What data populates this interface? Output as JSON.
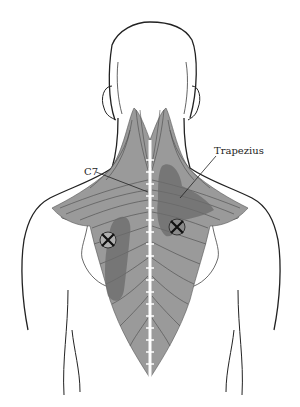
{
  "figure": {
    "labels": {
      "c7": "C7",
      "trapezius": "Trapezius"
    },
    "trigger_points": [
      {
        "id": "left-mid-trapezius",
        "cx": 108,
        "cy": 240
      },
      {
        "id": "right-mid-trapezius",
        "cx": 177,
        "cy": 227
      }
    ],
    "colors": {
      "outline": "#222222",
      "muscle_fill": "#9a9a9a",
      "muscle_fiber": "#4a4a4a",
      "pain_zone": "#6b6b6b",
      "spine": "#ffffff",
      "background": "#ffffff"
    }
  }
}
